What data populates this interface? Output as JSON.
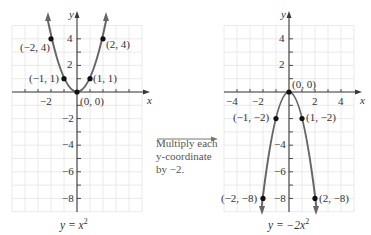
{
  "figure": {
    "left_graph": {
      "equation_label": "y = x²",
      "equation_parts": {
        "lhs": "y = x",
        "exp": "2"
      },
      "x_axis_label": "x",
      "y_axis_label": "y",
      "x_ticks_labeled": [
        "−2"
      ],
      "y_ticks_labeled": [
        "4",
        "2",
        "−2",
        "−4",
        "−6",
        "−8"
      ],
      "points": [
        {
          "label": "(−2, 4)",
          "x": -2,
          "y": 4
        },
        {
          "label": "(−1, 1)",
          "x": -1,
          "y": 1
        },
        {
          "label": "(0, 0)",
          "x": 0,
          "y": 0
        },
        {
          "label": "(1, 1)",
          "x": 1,
          "y": 1
        },
        {
          "label": "(2, 4)",
          "x": 2,
          "y": 4
        }
      ]
    },
    "transform_note": {
      "lines": [
        "Multiply each",
        "y-coordinate",
        "by −2."
      ]
    },
    "right_graph": {
      "equation_label": "y = −2x²",
      "equation_parts": {
        "lhs": "y = −2x",
        "exp": "2"
      },
      "x_axis_label": "x",
      "y_axis_label": "y",
      "x_ticks_labeled": [
        "−4",
        "−2",
        "2",
        "4"
      ],
      "y_ticks_labeled": [
        "4",
        "2",
        "−4",
        "−6",
        "−8"
      ],
      "points": [
        {
          "label": "(−2, −8)",
          "x": -2,
          "y": -8
        },
        {
          "label": "(−1, −2)",
          "x": -1,
          "y": -2
        },
        {
          "label": "(0, 0)",
          "x": 0,
          "y": 0
        },
        {
          "label": "(1, −2)",
          "x": 1,
          "y": -2
        },
        {
          "label": "(2, −8)",
          "x": 2,
          "y": -8
        }
      ]
    },
    "colors": {
      "curve": "#666666",
      "grid": "#e4e4e4",
      "axis": "#3a3a3a",
      "point": "#111111"
    }
  }
}
